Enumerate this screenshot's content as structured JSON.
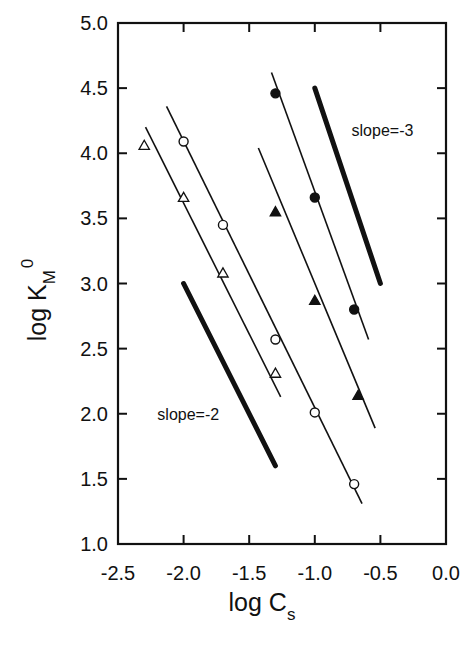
{
  "chart_data": {
    "type": "scatter",
    "title": "",
    "xlabel": "log C",
    "xlabel_sub": "s",
    "ylabel": "log K",
    "ylabel_sub": "M",
    "ylabel_sup": "0",
    "xlim": [
      -2.5,
      0.0
    ],
    "ylim": [
      1.0,
      5.0
    ],
    "xticks": [
      -2.5,
      -2.0,
      -1.5,
      -1.0,
      -0.5,
      0.0
    ],
    "xtick_labels": [
      "-2.5",
      "-2.0",
      "-1.5",
      "-1.0",
      "-0.5",
      "0.0"
    ],
    "yticks": [
      1.0,
      1.5,
      2.0,
      2.5,
      3.0,
      3.5,
      4.0,
      4.5,
      5.0
    ],
    "ytick_labels": [
      "1.0",
      "1.5",
      "2.0",
      "2.5",
      "3.0",
      "3.5",
      "4.0",
      "4.5",
      "5.0"
    ],
    "grid": false,
    "legend": null,
    "series": [
      {
        "name": "open circles",
        "marker": "circle-open",
        "x": [
          -2.0,
          -1.7,
          -1.3,
          -1.0,
          -0.7
        ],
        "y": [
          4.09,
          3.45,
          2.57,
          2.01,
          1.46
        ],
        "fit_line": [
          [
            -2.13,
            4.36
          ],
          [
            -0.64,
            1.31
          ]
        ]
      },
      {
        "name": "open triangles",
        "marker": "triangle-open",
        "x": [
          -2.3,
          -2.0,
          -1.7,
          -1.3
        ],
        "y": [
          4.06,
          3.66,
          3.08,
          2.31
        ],
        "fit_line": [
          [
            -2.29,
            4.2
          ],
          [
            -1.26,
            2.13
          ]
        ]
      },
      {
        "name": "filled circles",
        "marker": "circle-filled",
        "x": [
          -1.3,
          -1.0,
          -0.7
        ],
        "y": [
          4.46,
          3.66,
          2.8
        ],
        "fit_line": [
          [
            -1.33,
            4.62
          ],
          [
            -0.59,
            2.57
          ]
        ]
      },
      {
        "name": "filled triangles",
        "marker": "triangle-filled",
        "x": [
          -1.3,
          -1.0,
          -0.67
        ],
        "y": [
          3.55,
          2.87,
          2.14
        ],
        "fit_line": [
          [
            -1.43,
            4.04
          ],
          [
            -0.54,
            1.89
          ]
        ]
      }
    ],
    "reference_lines": [
      {
        "label": "slope=-2",
        "from": [
          -2.0,
          3.0
        ],
        "to": [
          -1.3,
          1.6
        ],
        "label_pos": [
          -2.2,
          2.0
        ]
      },
      {
        "label": "slope=-3",
        "from": [
          -1.0,
          4.5
        ],
        "to": [
          -0.5,
          3.0
        ],
        "label_pos": [
          -0.72,
          4.18
        ]
      }
    ]
  }
}
